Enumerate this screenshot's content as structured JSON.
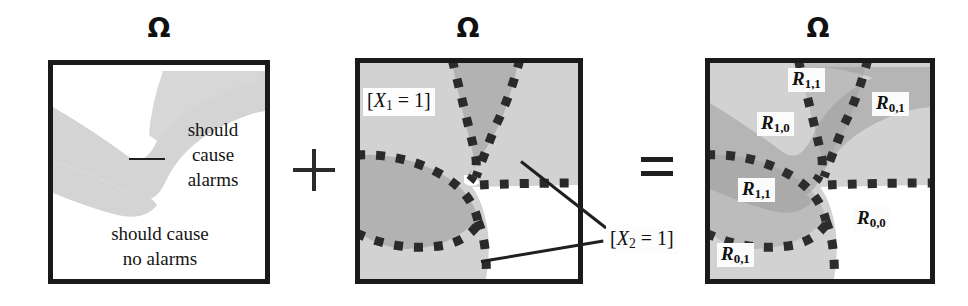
{
  "figure": {
    "title_symbol": "Ω",
    "equation_operators": {
      "plus": "+",
      "equals": "="
    },
    "background_color": "#ffffff",
    "ink_color": "#1a1a1a",
    "shade_light": "#d2d2d2",
    "shade_mid": "#c0c0c0",
    "shade_dark": "#a8a8a8",
    "shade_white": "#ffffff"
  },
  "panels": [
    {
      "id": "left",
      "omega": "Ω",
      "labels": [
        {
          "name": "should-cause-alarms",
          "lines": [
            "should",
            "cause",
            "alarms"
          ]
        },
        {
          "name": "should-cause-no-alarms",
          "lines": [
            "should cause",
            "no alarms"
          ]
        }
      ]
    },
    {
      "id": "middle",
      "omega": "Ω",
      "labels": [
        {
          "name": "x1-indicator",
          "text": "[X1 = 1]",
          "var": "X",
          "sub": "1",
          "value": "1"
        },
        {
          "name": "x2-indicator",
          "text": "[X2 = 1]",
          "var": "X",
          "sub": "2",
          "value": "1"
        }
      ]
    },
    {
      "id": "right",
      "omega": "Ω",
      "regions": [
        {
          "name": "region-r-1-1-top",
          "base": "R",
          "sub": "1,1",
          "x": 788,
          "y": 68
        },
        {
          "name": "region-r-0-1-top",
          "base": "R",
          "sub": "0,1",
          "x": 872,
          "y": 92
        },
        {
          "name": "region-r-1-0",
          "base": "R",
          "sub": "1,0",
          "x": 757,
          "y": 112
        },
        {
          "name": "region-r-1-1-mid",
          "base": "R",
          "sub": "1,1",
          "x": 738,
          "y": 178
        },
        {
          "name": "region-r-0-0",
          "base": "R",
          "sub": "0,0",
          "x": 853,
          "y": 207
        },
        {
          "name": "region-r-0-1-bottom",
          "base": "R",
          "sub": "0,1",
          "x": 717,
          "y": 243
        }
      ]
    }
  ],
  "left_panel_text": {
    "alarms_line1": "should",
    "alarms_line2": "cause",
    "alarms_line3": "alarms",
    "no_alarms_line1": "should cause",
    "no_alarms_line2": "no alarms"
  }
}
